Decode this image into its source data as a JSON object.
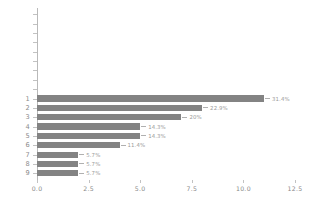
{
  "chart_data": {
    "type": "bar",
    "orientation": "horizontal",
    "title": "",
    "subtitle": "",
    "xlabel": "",
    "ylabel": "",
    "categories": [
      "1",
      "2",
      "3",
      "4",
      "5",
      "6",
      "7",
      "8",
      "9"
    ],
    "values": [
      11,
      8,
      7,
      5,
      5,
      4,
      2,
      2,
      2
    ],
    "data_labels": [
      "31.4%",
      "22.9%",
      "20%",
      "14.3%",
      "14.3%",
      "11.4%",
      "5.7%",
      "5.7%",
      "5.7%"
    ],
    "xlim": [
      0,
      12.5
    ],
    "xticks": [
      0,
      2.5,
      5,
      7.5,
      10,
      12.5
    ],
    "xticklabels": [
      "0.0",
      "2.5",
      "5.0",
      "7.5",
      "10.0",
      "12.5"
    ],
    "grid": false,
    "legend": false,
    "bar_color": "#838383",
    "axis_color": "#b9b9b9",
    "tick_label_color": "#8a8a8a",
    "data_label_color": "#9a9a9a",
    "background": "#ffffff",
    "empty_tick_slots": 9
  }
}
